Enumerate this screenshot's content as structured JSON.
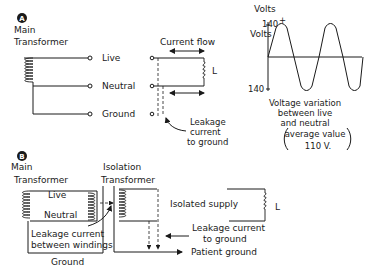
{
  "panel_a": {
    "badge": "A",
    "main_transformer_line1": "Main",
    "main_transformer_line2": "Transformer",
    "terminals": [
      "Live",
      "Neutral",
      "Ground"
    ],
    "current_flow": "Current flow",
    "load_label": "L",
    "leakage_line1": "Leakage",
    "leakage_line2": "current",
    "leakage_line3": "to ground",
    "graph": {
      "axis_label_top": "Volts",
      "top_value": "140",
      "top_unit": "Volts",
      "plus_sign": "+",
      "bottom_value": "140",
      "minus_sign": "-",
      "caption_line1": "Voltage variation",
      "caption_line2": "between live",
      "caption_line3": "and neutral",
      "caption_line4": "average value",
      "caption_line5": "110 V."
    }
  },
  "panel_b": {
    "badge": "B",
    "main_transformer_line1": "Main",
    "main_transformer_line2": "Transformer",
    "isolation_transformer_line1": "Isolation",
    "isolation_transformer_line2": "Transformer",
    "live": "Live",
    "neutral": "Neutral",
    "leakage_windings_line1": "Leakage current",
    "leakage_windings_line2": "between windings",
    "ground": "Ground",
    "isolated_supply": "Isolated supply",
    "load_label": "L",
    "leakage_ground_line1": "Leakage current",
    "leakage_ground_line2": "to ground",
    "patient_ground": "Patient ground"
  }
}
